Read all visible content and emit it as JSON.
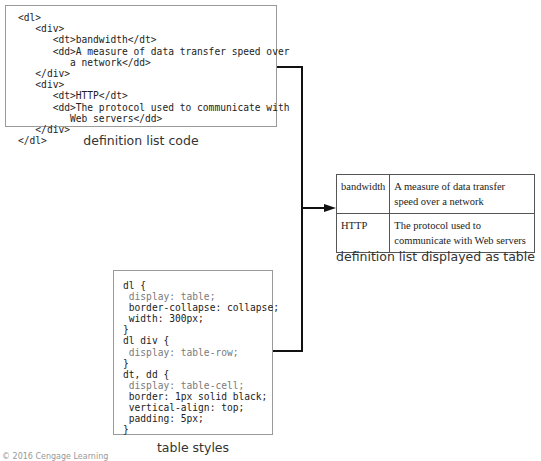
{
  "code_panel": {
    "caption": "definition list code",
    "lines": [
      "<dl>",
      "   <div>",
      "      <dt>bandwidth</dt>",
      "      <dd>A measure of data transfer speed over",
      "         a network</dd>",
      "   </div>",
      "   <div>",
      "      <dt>HTTP</dt>",
      "      <dd>The protocol used to communicate with",
      "         Web servers</dd>",
      "   </div>",
      "</dl>"
    ]
  },
  "styles_panel": {
    "caption": "table styles",
    "lines": [
      "dl {",
      " display: table;",
      " border-collapse: collapse;",
      " width: 300px;",
      "}",
      "dl div {",
      " display: table-row;",
      "}",
      "dt, dd {",
      " display: table-cell;",
      " border: 1px solid black;",
      " vertical-align: top;",
      " padding: 5px;",
      "}"
    ],
    "highlighted_line_indices": [
      1,
      6,
      9
    ]
  },
  "result_table": {
    "caption": "definition list displayed as table",
    "rows": [
      {
        "term": "bandwidth",
        "definition": "A measure of data transfer speed over a network"
      },
      {
        "term": "HTTP",
        "definition": "The protocol used to communicate with Web servers"
      }
    ]
  },
  "colors": {
    "line": "#111111",
    "box_border": "#9a9a9a",
    "dim_code": "#7a7a7a"
  },
  "footer": {
    "credit": "© 2016 Cengage Learning"
  }
}
